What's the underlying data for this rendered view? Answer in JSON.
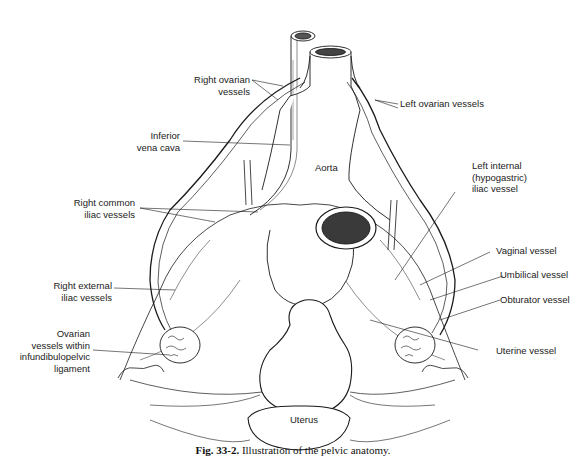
{
  "figure": {
    "caption_label": "Fig. 33-2.",
    "caption_text": "Illustration of the pelvic anatomy."
  },
  "labels": {
    "right_ovarian": [
      "Right ovarian",
      "vessels"
    ],
    "left_ovarian": "Left ovarian vessels",
    "inferior_vena_cava": [
      "Inferior",
      "vena cava"
    ],
    "aorta": "Aorta",
    "left_internal_iliac": [
      "Left internal",
      "(hypogastric)",
      "iliac vessel"
    ],
    "right_common_iliac": [
      "Right common",
      "iliac vessels"
    ],
    "vaginal": "Vaginal vessel",
    "umbilical": "Umbilical vessel",
    "obturator": "Obturator vessel",
    "right_external_iliac": [
      "Right external",
      "iliac vessels"
    ],
    "uterine": "Uterine vessel",
    "ovarian_ip": [
      "Ovarian",
      "vessels within",
      "infundibulopelvic",
      "ligament"
    ],
    "uterus": "Uterus",
    "bladder": "Bladder"
  },
  "colors": {
    "ink": "#1a1a1a",
    "background": "#ffffff",
    "dark_fill": "#3a3a3a"
  }
}
